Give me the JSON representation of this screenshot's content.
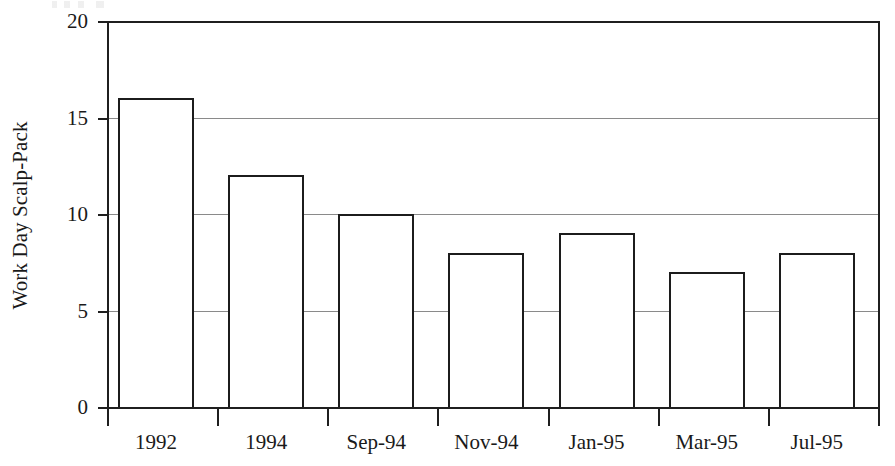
{
  "chart_data": {
    "type": "bar",
    "title": "",
    "xlabel": "",
    "ylabel": "Work Day Scalp-Pack",
    "categories": [
      "1992",
      "1994",
      "Sep-94",
      "Nov-94",
      "Jan-95",
      "Mar-95",
      "Jul-95"
    ],
    "values": [
      16,
      12,
      10,
      8,
      9,
      7,
      8
    ],
    "ylim": [
      0,
      20
    ],
    "ytick_labels": [
      "0",
      "5",
      "10",
      "15",
      "20"
    ],
    "ytick_values": [
      0,
      5,
      10,
      15,
      20
    ],
    "grid": true,
    "grid_axis": "y",
    "legend": "none",
    "series": [
      {
        "name": "Work Day Scalp-Pack",
        "values": [
          16,
          12,
          10,
          8,
          9,
          7,
          8
        ]
      }
    ],
    "colors": {
      "bar_fill": "#ffffff",
      "bar_edge": "#1c1c1c",
      "axis": "#1f1f1f",
      "gridline": "#8a8a8a",
      "text": "#1a1a1a",
      "background": "#ffffff"
    }
  }
}
